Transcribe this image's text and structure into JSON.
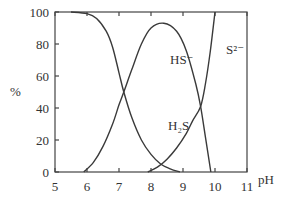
{
  "chart_data": {
    "type": "line",
    "title": "",
    "xlabel": "pH",
    "ylabel": "%",
    "xlim": [
      5,
      11
    ],
    "ylim": [
      0,
      100
    ],
    "x_ticks": [
      "5",
      "6",
      "7",
      "8",
      "9",
      "10",
      "11"
    ],
    "y_ticks": [
      "0",
      "20",
      "40",
      "60",
      "80",
      "100"
    ],
    "grid": false,
    "legend": "none (inline curve labels)",
    "series": [
      {
        "name": "H2S",
        "label": "H₂S",
        "x": [
          5.5,
          6.0,
          6.3,
          6.6,
          6.8,
          7.0,
          7.15,
          7.4,
          7.7,
          8.0,
          8.3,
          8.6,
          8.9
        ],
        "y": [
          100,
          99,
          96,
          88,
          78,
          62,
          50,
          34,
          20,
          11,
          5,
          2,
          0
        ]
      },
      {
        "name": "HS-",
        "label": "HS⁻",
        "x": [
          5.9,
          6.2,
          6.5,
          6.8,
          7.0,
          7.15,
          7.4,
          7.7,
          8.0,
          8.4,
          8.8,
          9.1,
          9.4,
          9.55,
          9.7,
          9.87
        ],
        "y": [
          0,
          6,
          16,
          30,
          42,
          50,
          64,
          80,
          90,
          93,
          88,
          76,
          55,
          41,
          22,
          0
        ]
      },
      {
        "name": "S2-",
        "label": "S²⁻",
        "x": [
          7.9,
          8.2,
          8.5,
          8.8,
          9.1,
          9.3,
          9.55,
          9.7,
          9.85,
          10.0
        ],
        "y": [
          0,
          3,
          8,
          15,
          24,
          32,
          41,
          55,
          75,
          100
        ]
      }
    ],
    "annotations": [
      {
        "text": "HS⁻",
        "x": 8.1,
        "y": 70
      },
      {
        "text": "H₂S",
        "x": 8.1,
        "y": 30
      },
      {
        "text": "S²⁻",
        "x": 10.25,
        "y": 70
      }
    ]
  },
  "labels": {
    "y_axis": "%",
    "x_axis": "pH",
    "hs_minus": "HS⁻",
    "h2s": "H₂S",
    "s2_minus": "S²⁻"
  }
}
